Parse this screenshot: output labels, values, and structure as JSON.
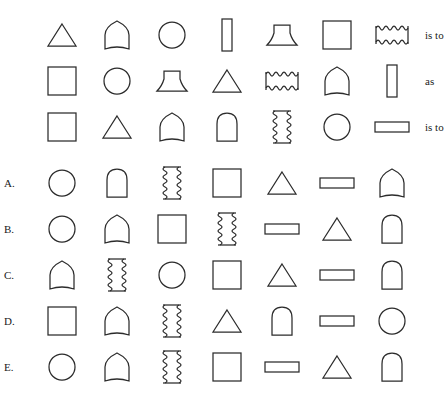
{
  "puzzle": {
    "type": "visual-analogy-matrix",
    "connectors": {
      "first": "is to",
      "second": "as",
      "third": "is to"
    },
    "shape_glyphs": {
      "triangle": "triangle",
      "pointed-arch": "pointed-arch",
      "rounded-arch": "rounded-arch",
      "circle": "circle",
      "vertical-bar": "vertical-bar",
      "trapezoid": "trapezoid",
      "square": "square",
      "wavy-horizontal": "wavy-horizontal",
      "wavy-vertical": "wavy-vertical",
      "horizontal-rect": "horizontal-rect"
    },
    "stem_rows": [
      {
        "id": "stem-row-1",
        "connector": "is to",
        "shapes": [
          "triangle",
          "pointed-arch",
          "circle",
          "vertical-bar",
          "trapezoid",
          "square",
          "wavy-horizontal"
        ]
      },
      {
        "id": "stem-row-2",
        "connector": "as",
        "shapes": [
          "square",
          "circle",
          "trapezoid",
          "triangle",
          "wavy-horizontal",
          "pointed-arch",
          "vertical-bar"
        ]
      },
      {
        "id": "stem-row-3",
        "connector": "is to",
        "shapes": [
          "square",
          "triangle",
          "pointed-arch",
          "rounded-arch",
          "wavy-vertical",
          "circle",
          "horizontal-rect"
        ]
      }
    ],
    "options": [
      {
        "label": "A.",
        "letter": "A",
        "shapes": [
          "circle",
          "rounded-arch",
          "wavy-vertical",
          "square",
          "triangle",
          "horizontal-rect",
          "pointed-arch"
        ]
      },
      {
        "label": "B.",
        "letter": "B",
        "shapes": [
          "circle",
          "pointed-arch",
          "square",
          "wavy-vertical",
          "horizontal-rect",
          "triangle",
          "rounded-arch"
        ]
      },
      {
        "label": "C.",
        "letter": "C",
        "shapes": [
          "pointed-arch",
          "wavy-vertical",
          "circle",
          "square",
          "triangle",
          "horizontal-rect",
          "rounded-arch"
        ]
      },
      {
        "label": "D.",
        "letter": "D",
        "shapes": [
          "square",
          "pointed-arch",
          "wavy-vertical",
          "triangle",
          "rounded-arch",
          "horizontal-rect",
          "circle"
        ]
      },
      {
        "label": "E.",
        "letter": "E",
        "shapes": [
          "circle",
          "pointed-arch",
          "wavy-vertical",
          "square",
          "horizontal-rect",
          "triangle",
          "rounded-arch"
        ]
      }
    ]
  },
  "colors": {
    "stroke": "#2b2b2b",
    "background": "#ffffff",
    "text": "#1a1a1a"
  }
}
